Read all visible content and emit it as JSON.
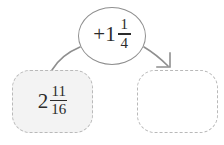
{
  "diagram": {
    "type": "function-machine",
    "operation": {
      "icon": "ellipse-bubble",
      "sign": "+",
      "whole": "1",
      "numerator": "1",
      "denominator": "4",
      "text": "+1 1/4"
    },
    "start_box": {
      "label": "starting value",
      "whole": "2",
      "numerator": "11",
      "denominator": "16",
      "text": "2 11/16",
      "filled": true
    },
    "result_box": {
      "label": "answer",
      "whole": "",
      "numerator": "",
      "denominator": "",
      "text": "",
      "filled": false
    },
    "connectors": {
      "input_arrow": "curve-no-head",
      "output_arrow": "curve-with-arrowhead"
    },
    "colors": {
      "stroke": "#8f8f8f",
      "dashed_border": "#b9b9b9",
      "box_fill": "#f3f3f3",
      "text": "#2b2b2b",
      "background": "#ffffff"
    }
  }
}
